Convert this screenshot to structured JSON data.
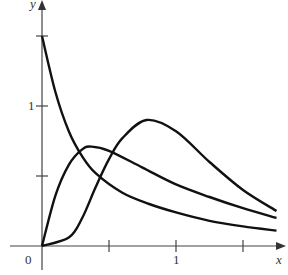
{
  "chart_data": {
    "type": "line",
    "title": "",
    "xlabel": "x",
    "ylabel": "y",
    "x_ticks": [
      0.5,
      1,
      1.5
    ],
    "x_tick_labels": [
      "",
      "1",
      ""
    ],
    "y_ticks": [
      0.5,
      1,
      1.5
    ],
    "y_tick_labels": [
      "",
      "1",
      ""
    ],
    "origin_label": "0",
    "xlim": [
      0,
      1.75
    ],
    "ylim": [
      0,
      1.6
    ],
    "grid": false,
    "legend": null,
    "series": [
      {
        "name": "decreasing curve",
        "x": [
          0,
          0.1,
          0.2,
          0.3,
          0.4,
          0.6,
          0.8,
          1.0,
          1.25,
          1.5,
          1.75
        ],
        "y": [
          1.5,
          1.1,
          0.82,
          0.64,
          0.52,
          0.38,
          0.3,
          0.24,
          0.18,
          0.14,
          0.11
        ]
      },
      {
        "name": "early peak curve",
        "x": [
          0,
          0.1,
          0.2,
          0.3,
          0.37,
          0.5,
          0.75,
          1.0,
          1.25,
          1.5,
          1.75
        ],
        "y": [
          0,
          0.36,
          0.58,
          0.69,
          0.71,
          0.68,
          0.56,
          0.44,
          0.35,
          0.27,
          0.2
        ]
      },
      {
        "name": "late peak curve",
        "x": [
          0,
          0.2,
          0.3,
          0.4,
          0.5,
          0.6,
          0.78,
          1.0,
          1.25,
          1.5,
          1.75
        ],
        "y": [
          0,
          0.06,
          0.2,
          0.42,
          0.62,
          0.77,
          0.9,
          0.82,
          0.6,
          0.4,
          0.25
        ]
      }
    ]
  },
  "axes": {
    "x_label": "x",
    "y_label": "y",
    "origin": "0",
    "x_one": "1",
    "y_one": "1"
  }
}
